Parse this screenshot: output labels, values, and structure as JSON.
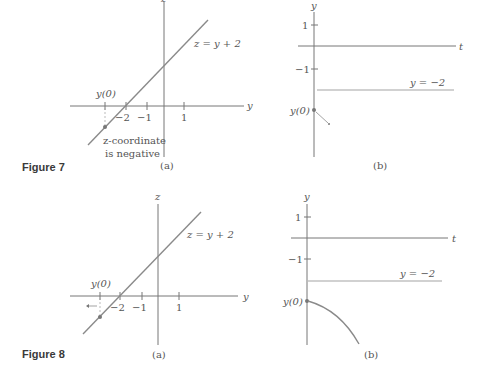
{
  "figures": [
    {
      "caption": "Figure 7",
      "panel_a": {
        "label": "(a)",
        "vertical_axis": "z",
        "horizontal_axis": "y",
        "line_label": "z = y + 2",
        "ticks": [
          "y(0)",
          "−2",
          "−1",
          "1"
        ],
        "annotation_line1": "z-coordinate",
        "annotation_line2": "is negative"
      },
      "panel_b": {
        "label": "(b)",
        "vertical_axis": "y",
        "horizontal_axis": "t",
        "ticks": [
          "1",
          "−1"
        ],
        "equilibrium_label": "y = −2",
        "initial_label": "y(0)"
      }
    },
    {
      "caption": "Figure 8",
      "panel_a": {
        "label": "(a)",
        "vertical_axis": "z",
        "horizontal_axis": "y",
        "line_label": "z = y + 2",
        "ticks": [
          "y(0)",
          "−2",
          "−1",
          "1"
        ]
      },
      "panel_b": {
        "label": "(b)",
        "vertical_axis": "y",
        "horizontal_axis": "t",
        "ticks": [
          "1",
          "−1"
        ],
        "equilibrium_label": "y = −2",
        "initial_label": "y(0)"
      }
    }
  ],
  "colors": {
    "axis": "#777777",
    "curve": "#8a8a8a",
    "text": "#555555",
    "caption": "#3a3a3a"
  }
}
